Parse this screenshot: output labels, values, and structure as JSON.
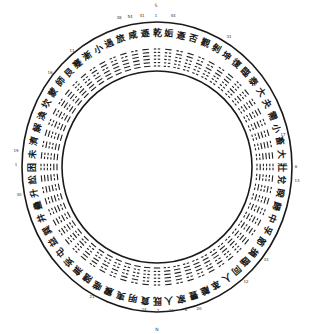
{
  "diagram": {
    "title": "",
    "type": "hexagram-circle",
    "center": {
      "x": 157,
      "y": 167
    },
    "outer_ring": {
      "rx": 135,
      "ry": 145
    },
    "inner_ring": {
      "rx": 95,
      "ry": 96
    },
    "hexagram_count": 64,
    "directions": [
      {
        "label": "S",
        "x": 156,
        "y": 7
      },
      {
        "label": "N",
        "x": 157,
        "y": 331
      }
    ],
    "number_labels": [
      {
        "text": "38",
        "x": 119,
        "y": 19
      },
      {
        "text": "54",
        "x": 130,
        "y": 18
      },
      {
        "text": "41",
        "x": 142,
        "y": 17
      },
      {
        "text": "1",
        "x": 156,
        "y": 17
      },
      {
        "text": "44",
        "x": 173,
        "y": 17
      },
      {
        "text": "11",
        "x": 72,
        "y": 52
      },
      {
        "text": "16",
        "x": 50,
        "y": 74
      },
      {
        "text": "19",
        "x": 16,
        "y": 152
      },
      {
        "text": "1",
        "x": 16,
        "y": 166
      },
      {
        "text": "30",
        "x": 19,
        "y": 196
      },
      {
        "text": "21",
        "x": 92,
        "y": 298
      },
      {
        "text": "24",
        "x": 144,
        "y": 311
      },
      {
        "text": "2",
        "x": 158,
        "y": 312
      },
      {
        "text": "23",
        "x": 171,
        "y": 312
      },
      {
        "text": "8",
        "x": 186,
        "y": 311
      },
      {
        "text": "20",
        "x": 199,
        "y": 310
      },
      {
        "text": "12",
        "x": 246,
        "y": 283
      },
      {
        "text": "33",
        "x": 266,
        "y": 261
      },
      {
        "text": "6",
        "x": 296,
        "y": 168
      },
      {
        "text": "13",
        "x": 297,
        "y": 182
      },
      {
        "text": "17",
        "x": 283,
        "y": 136
      },
      {
        "text": "31",
        "x": 229,
        "y": 38
      }
    ],
    "characters": [
      "乾",
      "姤",
      "遯",
      "否",
      "觀",
      "剝",
      "坤",
      "復",
      "臨",
      "泰",
      "大",
      "夬",
      "需",
      "小",
      "畜",
      "大",
      "壯",
      "兌",
      "睽",
      "歸",
      "中",
      "孚",
      "節",
      "損",
      "臨",
      "同",
      "人",
      "革",
      "離",
      "豐",
      "家",
      "人",
      "既",
      "賁",
      "明",
      "夷",
      "震",
      "噬",
      "隨",
      "無",
      "妄",
      "屯",
      "益",
      "巽",
      "井",
      "蠱",
      "升",
      "訟",
      "困",
      "未",
      "濟",
      "解",
      "渙",
      "坎",
      "蒙",
      "師",
      "艮",
      "蹇",
      "漸",
      "小",
      "過",
      "旅",
      "咸",
      "遯"
    ]
  }
}
